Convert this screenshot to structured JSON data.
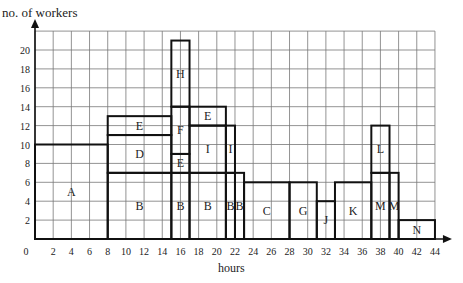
{
  "chart_data": {
    "type": "bar",
    "title": "",
    "xlabel": "hours",
    "ylabel": "no. of workers",
    "xlim": [
      0,
      44
    ],
    "ylim": [
      0,
      22
    ],
    "grid": true,
    "x_ticks": [
      0,
      2,
      4,
      6,
      8,
      10,
      12,
      14,
      16,
      18,
      20,
      22,
      24,
      26,
      28,
      30,
      32,
      34,
      36,
      38,
      40,
      42,
      44
    ],
    "y_ticks": [
      2,
      4,
      6,
      8,
      10,
      12,
      14,
      16,
      18,
      20
    ],
    "activities": [
      {
        "label": "A",
        "x0": 0,
        "x1": 8,
        "y0": 0,
        "y1": 10
      },
      {
        "label": "B",
        "x0": 8,
        "x1": 15,
        "y0": 0,
        "y1": 7
      },
      {
        "label": "B",
        "x0": 15,
        "x1": 17,
        "y0": 0,
        "y1": 7
      },
      {
        "label": "B",
        "x0": 17,
        "x1": 21,
        "y0": 0,
        "y1": 7
      },
      {
        "label": "B",
        "x0": 21,
        "x1": 22,
        "y0": 0,
        "y1": 7
      },
      {
        "label": "B",
        "x0": 22,
        "x1": 23,
        "y0": 0,
        "y1": 7
      },
      {
        "label": "D",
        "x0": 8,
        "x1": 15,
        "y0": 7,
        "y1": 11
      },
      {
        "label": "E",
        "x0": 8,
        "x1": 15,
        "y0": 11,
        "y1": 13
      },
      {
        "label": "E",
        "x0": 15,
        "x1": 17,
        "y0": 7,
        "y1": 9
      },
      {
        "label": "F",
        "x0": 15,
        "x1": 17,
        "y0": 9,
        "y1": 14
      },
      {
        "label": "E",
        "x0": 17,
        "x1": 21,
        "y0": 12,
        "y1": 14
      },
      {
        "label": "I",
        "x0": 17,
        "x1": 21,
        "y0": 7,
        "y1": 12
      },
      {
        "label": "I",
        "x0": 21,
        "x1": 22,
        "y0": 7,
        "y1": 12
      },
      {
        "label": "H",
        "x0": 15,
        "x1": 17,
        "y0": 14,
        "y1": 21
      },
      {
        "label": "C",
        "x0": 23,
        "x1": 28,
        "y0": 0,
        "y1": 6
      },
      {
        "label": "G",
        "x0": 28,
        "x1": 31,
        "y0": 0,
        "y1": 6
      },
      {
        "label": "J",
        "x0": 31,
        "x1": 33,
        "y0": 0,
        "y1": 4
      },
      {
        "label": "K",
        "x0": 33,
        "x1": 37,
        "y0": 0,
        "y1": 6
      },
      {
        "label": "M",
        "x0": 37,
        "x1": 39,
        "y0": 0,
        "y1": 7
      },
      {
        "label": "L",
        "x0": 37,
        "x1": 39,
        "y0": 7,
        "y1": 12
      },
      {
        "label": "M",
        "x0": 39,
        "x1": 40,
        "y0": 0,
        "y1": 7
      },
      {
        "label": "N",
        "x0": 40,
        "x1": 44,
        "y0": 0,
        "y1": 2
      }
    ]
  }
}
